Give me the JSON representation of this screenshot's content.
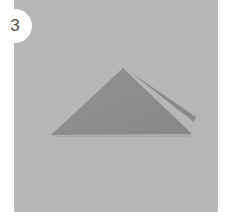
{
  "step": {
    "number": "3",
    "background_color": "#b6b6b6",
    "paper_color": "#8e8e8e",
    "shape": "triangle-fold"
  }
}
